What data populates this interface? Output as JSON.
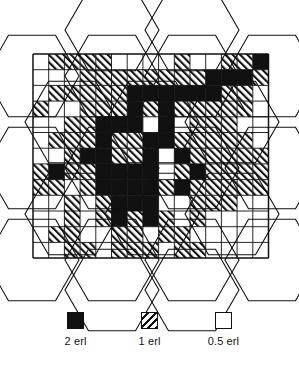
{
  "figure": {
    "type": "heatmap-grid-with-hexagon-overlay"
  },
  "chart_data": {
    "type": "heatmap",
    "title": "",
    "xlabel": "",
    "ylabel": "",
    "grid": true,
    "legend_position": "bottom",
    "value_map": {
      "black": 2,
      "hatch": 1,
      "white": 0.5
    },
    "units": "erl",
    "cols": 15,
    "rows": 13,
    "cell_px": 15.7,
    "origin": {
      "x": 33,
      "y": 54
    },
    "categories_x": [
      "1",
      "2",
      "3",
      "4",
      "5",
      "6",
      "7",
      "8",
      "9",
      "10",
      "11",
      "12",
      "13",
      "14",
      "15"
    ],
    "categories_y": [
      "1",
      "2",
      "3",
      "4",
      "5",
      "6",
      "7",
      "8",
      "9",
      "10",
      "11",
      "12",
      "13"
    ],
    "cells": [
      [
        "white",
        "hatch",
        "hatch",
        "hatch",
        "hatch",
        "white",
        "white",
        "white",
        "white",
        "hatch",
        "white",
        "white",
        "hatch",
        "hatch",
        "black"
      ],
      [
        "white",
        "white",
        "white",
        "hatch",
        "hatch",
        "hatch",
        "hatch",
        "hatch",
        "hatch",
        "hatch",
        "hatch",
        "black",
        "black",
        "black",
        "hatch"
      ],
      [
        "white",
        "hatch",
        "hatch",
        "hatch",
        "hatch",
        "hatch",
        "black",
        "black",
        "black",
        "black",
        "black",
        "black",
        "hatch",
        "hatch",
        "white"
      ],
      [
        "hatch",
        "white",
        "white",
        "hatch",
        "hatch",
        "hatch",
        "black",
        "hatch",
        "black",
        "hatch",
        "hatch",
        "hatch",
        "hatch",
        "hatch",
        "white"
      ],
      [
        "white",
        "white",
        "hatch",
        "hatch",
        "black",
        "black",
        "black",
        "white",
        "black",
        "white",
        "hatch",
        "hatch",
        "hatch",
        "white",
        "white"
      ],
      [
        "white",
        "hatch",
        "hatch",
        "hatch",
        "black",
        "hatch",
        "hatch",
        "black",
        "black",
        "hatch",
        "hatch",
        "hatch",
        "hatch",
        "hatch",
        "white"
      ],
      [
        "white",
        "white",
        "hatch",
        "black",
        "black",
        "hatch",
        "hatch",
        "black",
        "white",
        "black",
        "hatch",
        "hatch",
        "hatch",
        "hatch",
        "hatch"
      ],
      [
        "hatch",
        "black",
        "hatch",
        "hatch",
        "black",
        "black",
        "black",
        "black",
        "white",
        "hatch",
        "black",
        "hatch",
        "hatch",
        "hatch",
        "hatch"
      ],
      [
        "hatch",
        "hatch",
        "white",
        "hatch",
        "black",
        "black",
        "black",
        "black",
        "hatch",
        "black",
        "hatch",
        "hatch",
        "hatch",
        "hatch",
        "hatch"
      ],
      [
        "white",
        "white",
        "hatch",
        "white",
        "hatch",
        "black",
        "black",
        "black",
        "white",
        "white",
        "hatch",
        "hatch",
        "hatch",
        "white",
        "white"
      ],
      [
        "white",
        "white",
        "hatch",
        "white",
        "hatch",
        "black",
        "hatch",
        "black",
        "hatch",
        "white",
        "hatch",
        "white",
        "white",
        "white",
        "white"
      ],
      [
        "white",
        "hatch",
        "hatch",
        "white",
        "white",
        "hatch",
        "hatch",
        "white",
        "hatch",
        "hatch",
        "white",
        "white",
        "white",
        "white",
        "white"
      ],
      [
        "white",
        "white",
        "hatch",
        "hatch",
        "white",
        "hatch",
        "hatch",
        "hatch",
        "white",
        "hatch",
        "hatch",
        "white",
        "white",
        "white",
        "white"
      ]
    ]
  },
  "hexagons": {
    "radius": 47,
    "description": "hexagonal cell-site tessellation overlaid on traffic grid",
    "centers": [
      {
        "cx": 112,
        "cy": 30
      },
      {
        "cx": 192,
        "cy": 30
      },
      {
        "cx": 32,
        "cy": 76
      },
      {
        "cx": 112,
        "cy": 76
      },
      {
        "cx": 192,
        "cy": 76
      },
      {
        "cx": 272,
        "cy": 76
      },
      {
        "cx": 72,
        "cy": 122
      },
      {
        "cx": 152,
        "cy": 122
      },
      {
        "cx": 232,
        "cy": 122
      },
      {
        "cx": 32,
        "cy": 168
      },
      {
        "cx": 112,
        "cy": 168
      },
      {
        "cx": 192,
        "cy": 168
      },
      {
        "cx": 272,
        "cy": 168
      },
      {
        "cx": 72,
        "cy": 214
      },
      {
        "cx": 152,
        "cy": 214
      },
      {
        "cx": 232,
        "cy": 214
      },
      {
        "cx": 32,
        "cy": 260
      },
      {
        "cx": 112,
        "cy": 260
      },
      {
        "cx": 192,
        "cy": 260
      },
      {
        "cx": 272,
        "cy": 260
      },
      {
        "cx": 112,
        "cy": 290
      },
      {
        "cx": 192,
        "cy": 290
      }
    ]
  },
  "legend": {
    "items": [
      {
        "swatch": "solid-black-swatch",
        "style": "solid",
        "label": "2 erl",
        "value": 2
      },
      {
        "swatch": "hatched-swatch",
        "style": "hatch",
        "label": "1 erl",
        "value": 1
      },
      {
        "swatch": "white-swatch",
        "style": "white",
        "label": "0.5 erl",
        "value": 0.5
      }
    ]
  },
  "colors": {
    "ink": "#111111",
    "paper": "#ffffff"
  }
}
